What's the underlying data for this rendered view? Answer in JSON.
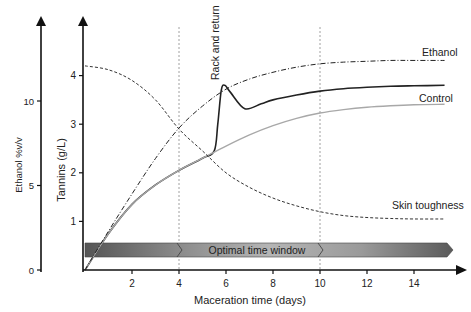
{
  "chart_data": {
    "type": "line",
    "title": "",
    "xlabel": "Maceration time (days)",
    "ylabel": "Tannins (g/L)",
    "ylabel_secondary": "Ethanol %v/v",
    "xlim": [
      0,
      15.5
    ],
    "ylim": [
      0,
      4.5
    ],
    "ylim_secondary": [
      0,
      13.5
    ],
    "xticks": [
      2,
      4,
      6,
      8,
      10,
      12,
      14
    ],
    "yticks": [
      1,
      2,
      3,
      4
    ],
    "yticks_secondary": [
      0,
      5,
      10
    ],
    "grid": false,
    "vertical_markers": [
      4,
      10
    ],
    "band": {
      "label": "Optimal time window",
      "from": 0,
      "to": 15.5,
      "segments": [
        0,
        4,
        10
      ]
    },
    "series": [
      {
        "name": "Control",
        "style": "solid-gray",
        "color": "#a8a8a8",
        "x": [
          0,
          1,
          2,
          3,
          4,
          5,
          6,
          7,
          8,
          9,
          10,
          11,
          12,
          13,
          14,
          15.3
        ],
        "values": [
          0,
          0.75,
          1.35,
          1.75,
          2.05,
          2.3,
          2.55,
          2.78,
          2.97,
          3.12,
          3.23,
          3.3,
          3.35,
          3.38,
          3.4,
          3.41
        ]
      },
      {
        "name": "Rack and return",
        "style": "solid-black",
        "color": "#222222",
        "x": [
          0,
          1,
          2,
          3,
          4,
          5,
          5.5,
          5.65,
          5.8,
          5.95,
          6.2,
          6.8,
          7.5,
          8,
          9,
          10,
          11,
          12,
          13,
          14,
          15.3
        ],
        "values": [
          0,
          0.75,
          1.35,
          1.75,
          2.05,
          2.3,
          2.45,
          3.0,
          3.7,
          3.8,
          3.65,
          3.32,
          3.42,
          3.5,
          3.6,
          3.68,
          3.73,
          3.76,
          3.78,
          3.79,
          3.8
        ]
      },
      {
        "name": "Ethanol",
        "style": "dash-dot",
        "color": "#222222",
        "axis": "secondary",
        "x": [
          0,
          1,
          2,
          3,
          4,
          5,
          6,
          7,
          8,
          9,
          10,
          11,
          12,
          13,
          14,
          15.3
        ],
        "values": [
          0,
          2.3,
          4.5,
          6.6,
          8.4,
          9.7,
          10.7,
          11.3,
          11.7,
          12.0,
          12.2,
          12.3,
          12.35,
          12.4,
          12.4,
          12.4
        ]
      },
      {
        "name": "Skin toughness",
        "style": "dashed",
        "color": "#333333",
        "x": [
          0,
          1,
          2,
          3,
          4,
          5,
          6,
          7,
          8,
          9,
          10,
          11,
          12,
          13,
          14,
          15.3
        ],
        "values": [
          4.2,
          4.12,
          3.9,
          3.5,
          2.9,
          2.45,
          2.0,
          1.7,
          1.48,
          1.32,
          1.2,
          1.12,
          1.08,
          1.06,
          1.05,
          1.05
        ]
      }
    ],
    "annotations": [
      {
        "text": "Rack and return",
        "x": 5.8,
        "rotation": -90
      },
      {
        "text": "Ethanol",
        "x": 14.6,
        "y": 4.45
      },
      {
        "text": "Control",
        "x": 14.4,
        "y": 3.58
      },
      {
        "text": "Skin toughness",
        "x": 13.8,
        "y": 1.35
      }
    ]
  },
  "labels": {
    "xlabel": "Maceration time (days)",
    "ylabel": "Tannins (g/L)",
    "ylabel_secondary": "Ethanol %v/v",
    "band": "Optimal time window",
    "ethanol": "Ethanol",
    "control": "Control",
    "skin": "Skin toughness",
    "rack": "Rack and return"
  }
}
